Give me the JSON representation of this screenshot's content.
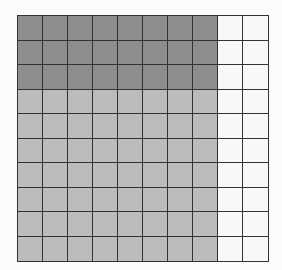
{
  "figure": {
    "type": "hundred-grid",
    "rows": 10,
    "cols": 10,
    "colors": {
      "dark": "#8e8e8e",
      "light": "#bcbcbc",
      "empty": "#f8f8f8",
      "line": "#333333"
    },
    "regions": [
      {
        "name": "dark-shaded",
        "rows": [
          0,
          2
        ],
        "cols": [
          0,
          7
        ],
        "count": 24
      },
      {
        "name": "light-shaded",
        "rows": [
          3,
          9
        ],
        "cols": [
          0,
          7
        ],
        "count": 56
      },
      {
        "name": "unshaded",
        "rows": [
          0,
          9
        ],
        "cols": [
          8,
          9
        ],
        "count": 20
      }
    ],
    "total_shaded": 80
  }
}
